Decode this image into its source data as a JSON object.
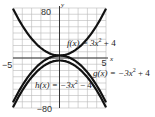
{
  "chart_data": {
    "type": "line",
    "title": "",
    "xlabel": "x",
    "ylabel": "y",
    "xlim": [
      -5,
      5
    ],
    "ylim": [
      -80,
      80
    ],
    "grid": true,
    "x_ticks_labeled": [
      -5,
      5
    ],
    "y_ticks_labeled": [
      80,
      -80
    ],
    "x_grid_step": 1,
    "y_grid_step": 10,
    "series": [
      {
        "name": "f(x) = 3x^2 + 4",
        "a": 3,
        "c": 4,
        "label_parts": [
          "f(x) = 3x",
          "2",
          " + 4"
        ],
        "x": [
          -5,
          -4,
          -3,
          -2,
          -1,
          0,
          1,
          2,
          3,
          4,
          5
        ],
        "values": [
          79,
          52,
          31,
          16,
          7,
          4,
          7,
          16,
          31,
          52,
          79
        ]
      },
      {
        "name": "g(x) = -3x^2 + 4",
        "a": -3,
        "c": 4,
        "label_parts": [
          "g(x) = −3x",
          "2",
          " + 4"
        ],
        "x": [
          -5,
          -4,
          -3,
          -2,
          -1,
          0,
          1,
          2,
          3,
          4,
          5
        ],
        "values": [
          -71,
          -44,
          -23,
          -8,
          1,
          4,
          1,
          -8,
          -23,
          -44,
          -71
        ]
      },
      {
        "name": "h(x) = -3x^2 - 4",
        "a": -3,
        "c": -4,
        "label_parts": [
          "h(x) = −3x",
          "2",
          " − 4"
        ],
        "x": [
          -5,
          -4,
          -3,
          -2,
          -1,
          0,
          1,
          2,
          3,
          4,
          5
        ],
        "values": [
          -79,
          -52,
          -31,
          -16,
          -7,
          -4,
          -7,
          -16,
          -31,
          -52,
          -79
        ]
      }
    ]
  },
  "axes": {
    "x_axis_letter": "x",
    "y_axis_letter": "y",
    "x_min_label": "−5",
    "x_max_label": "5",
    "y_max_label": "80",
    "y_min_label": "−80"
  },
  "style": {
    "curve_color": "#111111",
    "grid_color": "#b8b8b8",
    "axis_color": "#222222"
  }
}
